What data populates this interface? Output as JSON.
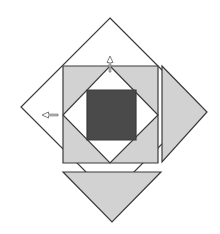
{
  "figure": {
    "width": 220,
    "height": 234,
    "background_color": "#ffffff",
    "colors": {
      "outline_stroke": "#3a3a3a",
      "light_gray_fill": "#d2d2d2",
      "dark_gray_fill": "#4a4a4a",
      "white_fill": "#ffffff",
      "arrow_fill": "#ffffff",
      "arrow_stroke": "#6e6e6e"
    },
    "stroke_width": 1.2,
    "shapes": [
      {
        "name": "outer-diamond",
        "kind": "polygon",
        "label": "Large rotated square (diamond) outline",
        "fill": "#ffffff",
        "stroke": "#3a3a3a",
        "points": "110,18 199,107 110,196 21,107"
      },
      {
        "name": "right-triangle-piece",
        "kind": "polygon",
        "label": "Detached right-pointing triangle piece",
        "fill": "#d2d2d2",
        "stroke": "#3a3a3a",
        "points": "162,66 207,112 162,162"
      },
      {
        "name": "bottom-triangle-piece",
        "kind": "polygon",
        "label": "Detached down-pointing triangle piece",
        "fill": "#d2d2d2",
        "stroke": "#3a3a3a",
        "points": "63,172 161,172 112,222"
      },
      {
        "name": "inner-axis-square",
        "kind": "polygon",
        "label": "Light gray axis-aligned square",
        "fill": "#d2d2d2",
        "stroke": "#3a3a3a",
        "points": "63,66 158,66 158,163 63,163"
      },
      {
        "name": "inner-diamond",
        "kind": "polygon",
        "label": "White rotated square inside",
        "fill": "#ffffff",
        "stroke": "#3a3a3a",
        "points": "110,66 158,115 110,163 63,115"
      },
      {
        "name": "center-dark-square",
        "kind": "polygon",
        "label": "Dark gray center square",
        "fill": "#4a4a4a",
        "stroke": "#3a3a3a",
        "points": "87,90 136,90 136,140 87,140"
      }
    ],
    "annotations": [
      {
        "name": "top-arrow-marker",
        "kind": "arrow",
        "label": "White arrow pointing up at top of inner shape",
        "direction": "up",
        "x": 110,
        "y": 72,
        "length": 16,
        "fill": "#ffffff",
        "stroke": "#6e6e6e"
      },
      {
        "name": "left-arrow-marker",
        "kind": "arrow",
        "label": "White arrow pointing left at left of inner shape",
        "direction": "left",
        "x": 58,
        "y": 115,
        "length": 16,
        "fill": "#ffffff",
        "stroke": "#6e6e6e"
      }
    ]
  }
}
